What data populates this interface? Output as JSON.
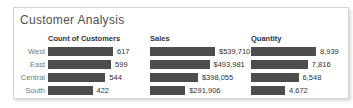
{
  "title": "Customer Analysis",
  "colors": {
    "bar": "#4d4d4d",
    "title_text": "#505050",
    "header_text": "#333333",
    "row_label_text": "#787878",
    "value_text": "#333333",
    "card_border": "#d4d4d4",
    "card_background": "#ffffff"
  },
  "chart_data": {
    "type": "bar",
    "orientation": "horizontal",
    "grid": false,
    "legend": "none",
    "title": "Customer Analysis",
    "categories": [
      "West",
      "East",
      "Central",
      "South"
    ],
    "series": [
      {
        "name": "Count of Customers",
        "values": [
          617,
          599,
          544,
          422
        ],
        "labels": [
          "617",
          "599",
          "544",
          "422"
        ],
        "xlim": [
          0,
          617
        ]
      },
      {
        "name": "Sales",
        "values": [
          539710,
          493981,
          398055,
          291906
        ],
        "labels": [
          "$539,710",
          "$493,981",
          "$398,055",
          "$291,906"
        ],
        "xlim": [
          0,
          539710
        ]
      },
      {
        "name": "Quantity",
        "values": [
          8939,
          7816,
          6548,
          4672
        ],
        "labels": [
          "8,939",
          "7,816",
          "6,548",
          "4,672"
        ],
        "xlim": [
          0,
          8939
        ]
      }
    ]
  }
}
